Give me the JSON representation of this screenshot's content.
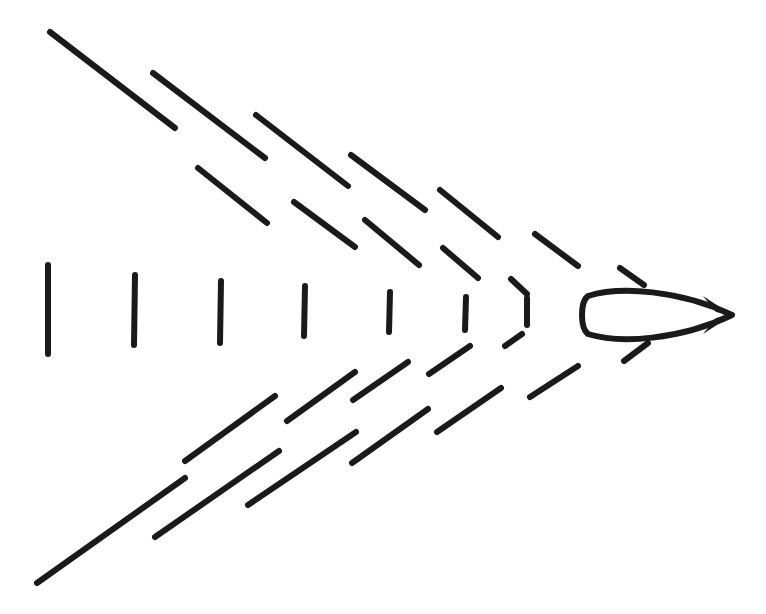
{
  "diagram": {
    "title": "",
    "stroke_color": "#1a1a1a",
    "background": "#ffffff",
    "vessel": {
      "shape": "leaf-hull",
      "bounds": {
        "x_min": 581,
        "x_max": 732,
        "y_min": 290,
        "y_max": 340
      },
      "tip": [
        732,
        315
      ]
    },
    "upper_outer_segments": [
      [
        50,
        32,
        175,
        128
      ],
      [
        153,
        73,
        265,
        158
      ],
      [
        256,
        115,
        348,
        186
      ],
      [
        351,
        155,
        425,
        210
      ],
      [
        440,
        190,
        498,
        237
      ],
      [
        535,
        234,
        578,
        266
      ],
      [
        620,
        268,
        644,
        285
      ]
    ],
    "upper_inner_segments": [
      [
        198,
        168,
        267,
        223
      ],
      [
        294,
        202,
        355,
        247
      ],
      [
        365,
        220,
        419,
        265
      ],
      [
        443,
        248,
        478,
        278
      ],
      [
        511,
        279,
        527,
        294
      ]
    ],
    "vertical_segments": [
      [
        48,
        265,
        48,
        354
      ],
      [
        135,
        275,
        134,
        345
      ],
      [
        221,
        281,
        220,
        343
      ],
      [
        305,
        286,
        304,
        336
      ],
      [
        390,
        292,
        389,
        332
      ],
      [
        466,
        297,
        465,
        330
      ],
      [
        527,
        298,
        527,
        325
      ]
    ],
    "lower_inner_segments": [
      [
        185,
        461,
        275,
        396
      ],
      [
        287,
        421,
        355,
        372
      ],
      [
        353,
        400,
        408,
        362
      ],
      [
        429,
        374,
        470,
        346
      ],
      [
        505,
        346,
        522,
        334
      ]
    ],
    "lower_outer_segments": [
      [
        37,
        583,
        185,
        478
      ],
      [
        155,
        537,
        279,
        451
      ],
      [
        248,
        505,
        356,
        432
      ],
      [
        352,
        463,
        428,
        409
      ],
      [
        437,
        432,
        501,
        388
      ],
      [
        530,
        397,
        578,
        366
      ],
      [
        624,
        361,
        648,
        343
      ]
    ]
  }
}
